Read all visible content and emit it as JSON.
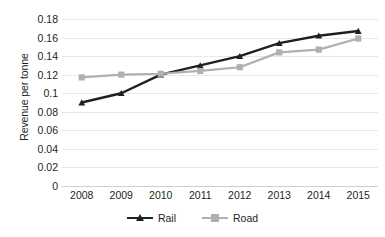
{
  "chart_data": {
    "type": "line",
    "title": "",
    "xlabel": "",
    "ylabel": "Revenue per tonne",
    "categories": [
      "2008",
      "2009",
      "2010",
      "2011",
      "2012",
      "2013",
      "2014",
      "2015"
    ],
    "series": [
      {
        "name": "Rail",
        "color": "#231f20",
        "marker": "triangle",
        "values": [
          0.09,
          0.1,
          0.12,
          0.13,
          0.14,
          0.154,
          0.162,
          0.167
        ]
      },
      {
        "name": "Road",
        "color": "#b0b0b0",
        "marker": "square",
        "values": [
          0.117,
          0.12,
          0.121,
          0.124,
          0.128,
          0.144,
          0.147,
          0.159
        ]
      }
    ],
    "ylim": [
      0,
      0.18
    ],
    "yticks": [
      0,
      0.02,
      0.04,
      0.06,
      0.08,
      0.1,
      0.12,
      0.14,
      0.16,
      0.18
    ],
    "ytick_labels": [
      "0",
      "0.02",
      "0.04",
      "0.06",
      "0.08",
      "0.1",
      "0.12",
      "0.14",
      "0.16",
      "0.18"
    ],
    "grid": true,
    "legend_position": "bottom"
  },
  "axes": {
    "y_title": "Revenue per tonne"
  },
  "legend": {
    "items": [
      {
        "label": "Rail"
      },
      {
        "label": "Road"
      }
    ]
  },
  "colors": {
    "rail": "#231f20",
    "road": "#b0b0b0",
    "gridline": "#e8e8e8",
    "background": "#ffffff",
    "text": "#231f20"
  }
}
